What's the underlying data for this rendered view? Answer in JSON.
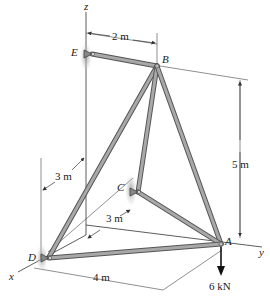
{
  "diagram": {
    "axes": {
      "x": "x",
      "y": "y",
      "z": "z"
    },
    "nodes": [
      {
        "id": "A",
        "label": "A"
      },
      {
        "id": "B",
        "label": "B"
      },
      {
        "id": "C",
        "label": "C"
      },
      {
        "id": "D",
        "label": "D"
      },
      {
        "id": "E",
        "label": "E"
      }
    ],
    "members": [
      "EB",
      "BD",
      "BC",
      "BA",
      "CA",
      "DA"
    ],
    "dimensions": {
      "eb_offset": "2 m",
      "height": "5 m",
      "d_x_offset": "3 m",
      "c_offset": "3 m",
      "da_length": "4 m"
    },
    "load": {
      "label": "6 kN",
      "at": "A",
      "direction": "down"
    },
    "supports": [
      "E",
      "C",
      "D"
    ],
    "colors": {
      "member": "#8a8a8a",
      "member_dark": "#555555",
      "support_shadow": "#b8b8b8",
      "line": "#333333",
      "arrow": "#111111"
    }
  }
}
